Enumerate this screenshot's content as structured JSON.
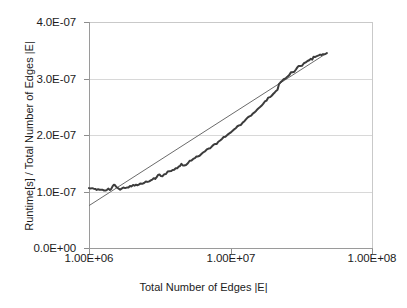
{
  "chart_data": {
    "type": "line",
    "title": "",
    "xlabel": "Total Number of Edges |E|",
    "ylabel": "Runtime[s] / Total Number of Edges |E|",
    "xscale": "log",
    "yscale": "linear",
    "xlim": [
      1000000,
      100000000
    ],
    "ylim": [
      0,
      4e-07
    ],
    "grid": "horizontal",
    "legend": "none",
    "xticks": [
      {
        "value": 1000000,
        "label": "1.00E+06"
      },
      {
        "value": 10000000,
        "label": "1.00E+07"
      },
      {
        "value": 100000000,
        "label": "1.00E+08"
      }
    ],
    "yticks": [
      {
        "value": 0,
        "label": "0.0E+00"
      },
      {
        "value": 1e-07,
        "label": "1.0E-07"
      },
      {
        "value": 2e-07,
        "label": "2.0E-07"
      },
      {
        "value": 3e-07,
        "label": "3.0E-07"
      },
      {
        "value": 4e-07,
        "label": "4.0E-07"
      }
    ],
    "series": [
      {
        "name": "measured-runtime-per-edge",
        "style": "noisy-line",
        "color": "#3c3c3c",
        "points": [
          [
            1000000,
            1.06e-07
          ],
          [
            1080000,
            1.05e-07
          ],
          [
            1160000,
            1.04e-07
          ],
          [
            1250000,
            1.03e-07
          ],
          [
            1340000,
            1.03e-07
          ],
          [
            1440000,
            1.05e-07
          ],
          [
            1500000,
            1.12e-07
          ],
          [
            1560000,
            1.08e-07
          ],
          [
            1620000,
            1.05e-07
          ],
          [
            1700000,
            1.05e-07
          ],
          [
            1800000,
            1.06e-07
          ],
          [
            1900000,
            1.07e-07
          ],
          [
            2000000,
            1.09e-07
          ],
          [
            2150000,
            1.12e-07
          ],
          [
            2300000,
            1.14e-07
          ],
          [
            2450000,
            1.15e-07
          ],
          [
            2600000,
            1.17e-07
          ],
          [
            2800000,
            1.21e-07
          ],
          [
            3000000,
            1.25e-07
          ],
          [
            3150000,
            1.3e-07
          ],
          [
            3300000,
            1.27e-07
          ],
          [
            3500000,
            1.31e-07
          ],
          [
            3700000,
            1.36e-07
          ],
          [
            3900000,
            1.38e-07
          ],
          [
            4100000,
            1.41e-07
          ],
          [
            4300000,
            1.44e-07
          ],
          [
            4500000,
            1.49e-07
          ],
          [
            4700000,
            1.46e-07
          ],
          [
            5000000,
            1.5e-07
          ],
          [
            5300000,
            1.55e-07
          ],
          [
            5600000,
            1.59e-07
          ],
          [
            5900000,
            1.62e-07
          ],
          [
            6200000,
            1.66e-07
          ],
          [
            6600000,
            1.71e-07
          ],
          [
            7000000,
            1.76e-07
          ],
          [
            7400000,
            1.8e-07
          ],
          [
            7800000,
            1.84e-07
          ],
          [
            8200000,
            1.88e-07
          ],
          [
            8700000,
            1.93e-07
          ],
          [
            9200000,
            1.97e-07
          ],
          [
            9700000,
            2.02e-07
          ],
          [
            10300000,
            2.07e-07
          ],
          [
            10900000,
            2.12e-07
          ],
          [
            11500000,
            2.17e-07
          ],
          [
            12200000,
            2.22e-07
          ],
          [
            12900000,
            2.28e-07
          ],
          [
            13600000,
            2.33e-07
          ],
          [
            14400000,
            2.38e-07
          ],
          [
            15200000,
            2.43e-07
          ],
          [
            16100000,
            2.49e-07
          ],
          [
            17000000,
            2.55e-07
          ],
          [
            18000000,
            2.61e-07
          ],
          [
            19000000,
            2.67e-07
          ],
          [
            20100000,
            2.73e-07
          ],
          [
            21000000,
            2.78e-07
          ],
          [
            21500000,
            2.8e-07
          ],
          [
            22000000,
            2.9e-07
          ],
          [
            23000000,
            2.95e-07
          ],
          [
            24500000,
            3e-07
          ],
          [
            26000000,
            3.06e-07
          ],
          [
            27500000,
            3.11e-07
          ],
          [
            29000000,
            3.16e-07
          ],
          [
            31000000,
            3.22e-07
          ],
          [
            33000000,
            3.27e-07
          ],
          [
            35000000,
            3.31e-07
          ],
          [
            37000000,
            3.35e-07
          ],
          [
            39500000,
            3.38e-07
          ],
          [
            42000000,
            3.41e-07
          ],
          [
            45000000,
            3.43e-07
          ],
          [
            48000000,
            3.45e-07
          ]
        ]
      },
      {
        "name": "linear-trend-line",
        "style": "straight-line",
        "color": "#6b6b6b",
        "points": [
          [
            1000000,
            7.5e-08
          ],
          [
            48000000,
            3.45e-07
          ]
        ]
      }
    ]
  }
}
